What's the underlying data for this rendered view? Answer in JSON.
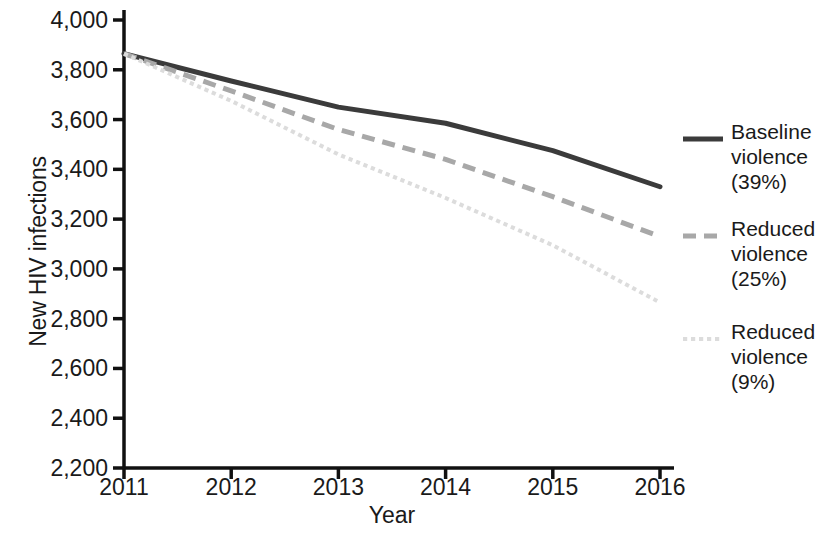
{
  "chart_data": {
    "type": "line",
    "title": "",
    "xlabel": "Year",
    "ylabel": "New HIV infections",
    "x": [
      2011,
      2012,
      2013,
      2014,
      2015,
      2016
    ],
    "xtick_labels": [
      "2011",
      "2012",
      "2013",
      "2014",
      "2015",
      "2016"
    ],
    "ytick_labels": [
      "2,200",
      "2,400",
      "2,600",
      "2,800",
      "3,000",
      "3,200",
      "3,400",
      "3,600",
      "3,800",
      "4,000"
    ],
    "ytick_values": [
      2200,
      2400,
      2600,
      2800,
      3000,
      3200,
      3400,
      3600,
      3800,
      4000
    ],
    "xlim": [
      2011,
      2016
    ],
    "ylim": [
      2200,
      4000
    ],
    "grid": false,
    "legend_position": "right",
    "series": [
      {
        "name": "Baseline violence (39%)",
        "label_lines": "Baseline\nviolence\n(39%)",
        "style": "solid",
        "color": "#3b3b3b",
        "width": 5,
        "values": [
          3865,
          3755,
          3650,
          3585,
          3475,
          3330
        ]
      },
      {
        "name": "Reduced violence (25%)",
        "label_lines": "Reduced\nviolence\n(25%)",
        "style": "dashed",
        "color": "#a8a8a8",
        "width": 5,
        "values": [
          3865,
          3715,
          3560,
          3440,
          3290,
          3130
        ]
      },
      {
        "name": "Reduced violence (9%)",
        "label_lines": "Reduced\nviolence\n(9%)",
        "style": "dotted",
        "color": "#dcdcdc",
        "width": 4,
        "values": [
          3865,
          3675,
          3460,
          3285,
          3095,
          2865
        ]
      }
    ]
  },
  "axis": {
    "y_title": "New HIV infections",
    "x_title": "Year",
    "color": "#111111"
  },
  "legend": {
    "entries": [
      {
        "label": "Baseline\nviolence\n(39%)"
      },
      {
        "label": "Reduced\nviolence\n(25%)"
      },
      {
        "label": "Reduced\nviolence\n(9%)"
      }
    ]
  }
}
